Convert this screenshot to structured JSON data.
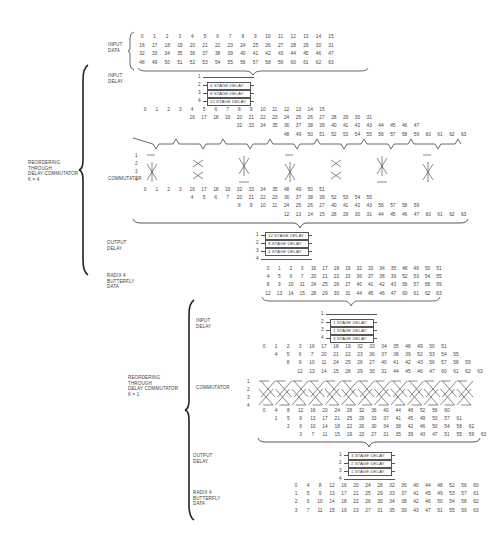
{
  "section1": {
    "input_data_label": [
      "INPUT",
      "DATA"
    ],
    "input_rows": [
      [
        "0",
        "1",
        "2",
        "3",
        "4",
        "5",
        "6",
        "7",
        "8",
        "9",
        "10",
        "11",
        "12",
        "13",
        "14",
        "15"
      ],
      [
        "16",
        "17",
        "18",
        "19",
        "20",
        "21",
        "22",
        "23",
        "24",
        "25",
        "26",
        "27",
        "28",
        "29",
        "30",
        "31"
      ],
      [
        "32",
        "33",
        "34",
        "35",
        "36",
        "37",
        "38",
        "39",
        "40",
        "41",
        "42",
        "43",
        "44",
        "45",
        "46",
        "47"
      ],
      [
        "48",
        "49",
        "50",
        "51",
        "52",
        "53",
        "54",
        "55",
        "56",
        "57",
        "58",
        "59",
        "60",
        "61",
        "62",
        "63"
      ]
    ],
    "reorder_label": [
      "REORDERING",
      "THROUGH",
      "DELAY COMMUTATOR",
      "K = 4"
    ],
    "input_delay_label": [
      "INPUT",
      "DELAY"
    ],
    "input_delays": [
      {
        "index": "1",
        "box": ""
      },
      {
        "index": "2",
        "box": "4 STAGE DELAY"
      },
      {
        "index": "3",
        "box": "8 STAGE DELAY"
      },
      {
        "index": "4",
        "box": "12 STAGE DELAY"
      }
    ],
    "delayed_rows": [
      {
        "offset": 0,
        "values": [
          "0",
          "1",
          "2",
          "3",
          "4",
          "5",
          "6",
          "7",
          "8",
          "9",
          "10",
          "11",
          "12",
          "13",
          "14",
          "15"
        ]
      },
      {
        "offset": 4,
        "values": [
          "16",
          "17",
          "18",
          "19",
          "20",
          "21",
          "22",
          "23",
          "24",
          "25",
          "26",
          "27",
          "28",
          "29",
          "30",
          "31"
        ]
      },
      {
        "offset": 8,
        "values": [
          "32",
          "33",
          "34",
          "35",
          "36",
          "37",
          "38",
          "39",
          "40",
          "41",
          "42",
          "43",
          "44",
          "45",
          "46",
          "47"
        ]
      },
      {
        "offset": 12,
        "values": [
          "48",
          "49",
          "50",
          "51",
          "52",
          "53",
          "54",
          "55",
          "56",
          "57",
          "58",
          "59",
          "60",
          "61",
          "62",
          "63"
        ]
      }
    ],
    "commutator_label": "COMMUTATOR",
    "commutator_line_labels": [
      "1",
      "2",
      "3",
      "4"
    ],
    "commuted_rows": [
      {
        "offset": 0,
        "values": [
          "0",
          "1",
          "2",
          "3",
          "16",
          "17",
          "18",
          "19",
          "32",
          "33",
          "34",
          "35",
          "48",
          "49",
          "50",
          "51"
        ]
      },
      {
        "offset": 4,
        "values": [
          "4",
          "5",
          "6",
          "7",
          "20",
          "21",
          "22",
          "23",
          "36",
          "37",
          "38",
          "39",
          "52",
          "53",
          "54",
          "55"
        ]
      },
      {
        "offset": 8,
        "values": [
          "8",
          "9",
          "10",
          "11",
          "24",
          "25",
          "26",
          "27",
          "40",
          "41",
          "42",
          "43",
          "56",
          "57",
          "58",
          "59"
        ]
      },
      {
        "offset": 12,
        "values": [
          "12",
          "13",
          "14",
          "15",
          "28",
          "29",
          "30",
          "31",
          "44",
          "45",
          "46",
          "47",
          "60",
          "61",
          "62",
          "63"
        ]
      }
    ],
    "output_delay_label": [
      "OUTPUT",
      "DELAY"
    ],
    "output_delays": [
      {
        "index": "1",
        "box": "12 STAGE DELAY"
      },
      {
        "index": "2",
        "box": "8 STAGE DELAY"
      },
      {
        "index": "3",
        "box": "4 STAGE DELAY"
      },
      {
        "index": "4",
        "box": ""
      }
    ],
    "butterfly_label": [
      "RADIX 4",
      "BUTTERFLY",
      "DATA"
    ],
    "butterfly_rows": [
      [
        "0",
        "1",
        "2",
        "3",
        "16",
        "17",
        "18",
        "19",
        "32",
        "33",
        "34",
        "35",
        "48",
        "49",
        "50",
        "51"
      ],
      [
        "4",
        "5",
        "6",
        "7",
        "20",
        "21",
        "22",
        "23",
        "36",
        "37",
        "38",
        "39",
        "52",
        "53",
        "54",
        "55"
      ],
      [
        "8",
        "9",
        "10",
        "11",
        "24",
        "25",
        "26",
        "27",
        "40",
        "41",
        "42",
        "43",
        "56",
        "57",
        "58",
        "59"
      ],
      [
        "12",
        "13",
        "14",
        "15",
        "28",
        "29",
        "30",
        "31",
        "44",
        "45",
        "46",
        "47",
        "60",
        "61",
        "62",
        "63"
      ]
    ]
  },
  "section2": {
    "reorder_label": [
      "REORDERING",
      "THROUGH",
      "DELAY COMMUTATOR",
      "K = 1"
    ],
    "input_delay_label": [
      "INPUT",
      "DELAY"
    ],
    "input_delays": [
      {
        "index": "1",
        "box": ""
      },
      {
        "index": "2",
        "box": "1 STAGE DELAY"
      },
      {
        "index": "3",
        "box": "2 STAGE DELAY"
      },
      {
        "index": "4",
        "box": "3 STAGE DELAY"
      }
    ],
    "delayed_rows": [
      {
        "offset": 0,
        "values": [
          "0",
          "1",
          "2",
          "3",
          "16",
          "17",
          "18",
          "19",
          "32",
          "33",
          "34",
          "35",
          "48",
          "49",
          "50",
          "51"
        ]
      },
      {
        "offset": 1,
        "values": [
          "4",
          "5",
          "6",
          "7",
          "20",
          "21",
          "22",
          "23",
          "36",
          "37",
          "38",
          "39",
          "52",
          "53",
          "54",
          "55"
        ]
      },
      {
        "offset": 2,
        "values": [
          "8",
          "9",
          "10",
          "11",
          "24",
          "25",
          "26",
          "27",
          "40",
          "41",
          "42",
          "43",
          "56",
          "57",
          "58",
          "59"
        ]
      },
      {
        "offset": 3,
        "values": [
          "12",
          "13",
          "14",
          "15",
          "28",
          "29",
          "30",
          "31",
          "44",
          "45",
          "46",
          "47",
          "60",
          "61",
          "62",
          "63"
        ]
      }
    ],
    "commutator_label": "COMMUTATOR",
    "commutator_line_labels": [
      "1",
      "2",
      "3",
      "4"
    ],
    "commuted_rows": [
      {
        "offset": 0,
        "values": [
          "0",
          "4",
          "8",
          "12",
          "16",
          "20",
          "24",
          "28",
          "32",
          "36",
          "40",
          "44",
          "48",
          "52",
          "56",
          "60"
        ]
      },
      {
        "offset": 1,
        "values": [
          "1",
          "5",
          "9",
          "13",
          "17",
          "21",
          "25",
          "29",
          "33",
          "37",
          "41",
          "45",
          "49",
          "53",
          "57",
          "61"
        ]
      },
      {
        "offset": 2,
        "values": [
          "2",
          "6",
          "10",
          "14",
          "18",
          "22",
          "26",
          "30",
          "34",
          "38",
          "42",
          "46",
          "50",
          "54",
          "58",
          "62"
        ]
      },
      {
        "offset": 3,
        "values": [
          "3",
          "7",
          "11",
          "15",
          "19",
          "23",
          "27",
          "31",
          "35",
          "39",
          "43",
          "47",
          "51",
          "55",
          "59",
          "63"
        ]
      }
    ],
    "output_delay_label": [
      "OUTPUT",
      "DELAY"
    ],
    "output_delays": [
      {
        "index": "1",
        "box": "3 STAGE DELAY"
      },
      {
        "index": "2",
        "box": "2 STAGE DELAY"
      },
      {
        "index": "3",
        "box": "1 STAGE DELAY"
      },
      {
        "index": "4",
        "box": ""
      }
    ],
    "butterfly_label": [
      "RADIX 4",
      "BUTTERFLY",
      "DATA"
    ],
    "butterfly_rows": [
      [
        "0",
        "4",
        "8",
        "12",
        "16",
        "20",
        "24",
        "28",
        "32",
        "36",
        "40",
        "44",
        "48",
        "52",
        "56",
        "60"
      ],
      [
        "1",
        "5",
        "9",
        "13",
        "17",
        "21",
        "25",
        "29",
        "33",
        "37",
        "41",
        "45",
        "49",
        "53",
        "57",
        "61"
      ],
      [
        "2",
        "6",
        "10",
        "14",
        "18",
        "22",
        "26",
        "30",
        "34",
        "38",
        "42",
        "46",
        "50",
        "54",
        "58",
        "62"
      ],
      [
        "3",
        "7",
        "11",
        "15",
        "19",
        "23",
        "27",
        "31",
        "35",
        "39",
        "43",
        "47",
        "51",
        "55",
        "59",
        "63"
      ]
    ]
  }
}
